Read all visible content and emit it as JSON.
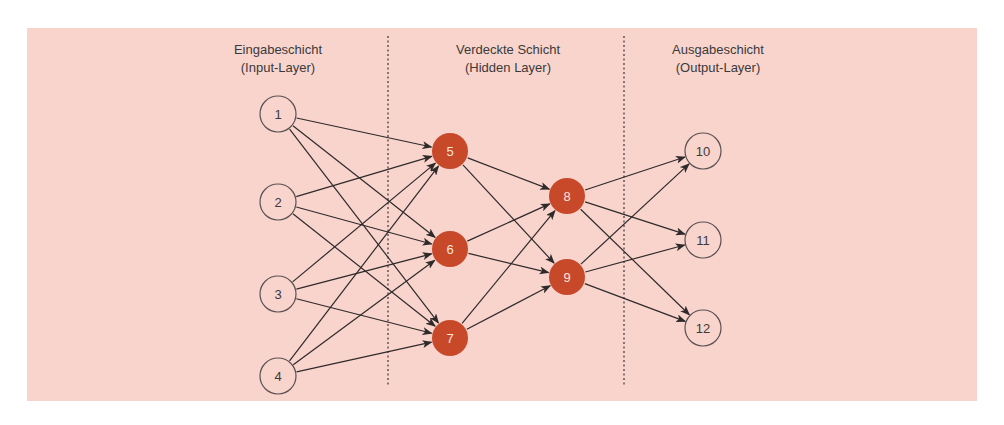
{
  "colors": {
    "background": "#f8d4cd",
    "edge": "#2f2a2a",
    "divider": "#4a4040",
    "node_outline": "#5a5050",
    "node_open_fill": "#f8d4cd",
    "node_open_text": "#3a3a3a",
    "node_hidden_fill": "#c8482a",
    "node_hidden_text": "#f8e4dc"
  },
  "layers": [
    {
      "id": "input",
      "title": "Eingabeschicht",
      "subtitle": "(Input-Layer)",
      "label_x": 278
    },
    {
      "id": "hidden",
      "title": "Verdeckte Schicht",
      "subtitle": "(Hidden Layer)",
      "label_x": 508
    },
    {
      "id": "output",
      "title": "Ausgabeschicht",
      "subtitle": "(Output-Layer)",
      "label_x": 718
    }
  ],
  "dividers": [
    {
      "x": 388
    },
    {
      "x": 624
    }
  ],
  "nodes": [
    {
      "id": "1",
      "label": "1",
      "x": 278,
      "y": 114,
      "type": "input"
    },
    {
      "id": "2",
      "label": "2",
      "x": 278,
      "y": 202,
      "type": "input"
    },
    {
      "id": "3",
      "label": "3",
      "x": 278,
      "y": 294,
      "type": "input"
    },
    {
      "id": "4",
      "label": "4",
      "x": 278,
      "y": 376,
      "type": "input"
    },
    {
      "id": "5",
      "label": "5",
      "x": 450,
      "y": 151,
      "type": "hidden"
    },
    {
      "id": "6",
      "label": "6",
      "x": 450,
      "y": 249,
      "type": "hidden"
    },
    {
      "id": "7",
      "label": "7",
      "x": 450,
      "y": 338,
      "type": "hidden"
    },
    {
      "id": "8",
      "label": "8",
      "x": 567,
      "y": 196,
      "type": "hidden"
    },
    {
      "id": "9",
      "label": "9",
      "x": 567,
      "y": 277,
      "type": "hidden"
    },
    {
      "id": "10",
      "label": "10",
      "x": 703,
      "y": 151,
      "type": "output"
    },
    {
      "id": "11",
      "label": "11",
      "x": 703,
      "y": 240,
      "type": "output"
    },
    {
      "id": "12",
      "label": "12",
      "x": 703,
      "y": 328,
      "type": "output"
    }
  ],
  "edges": [
    [
      "1",
      "5"
    ],
    [
      "1",
      "6"
    ],
    [
      "1",
      "7"
    ],
    [
      "2",
      "5"
    ],
    [
      "2",
      "6"
    ],
    [
      "2",
      "7"
    ],
    [
      "3",
      "5"
    ],
    [
      "3",
      "6"
    ],
    [
      "3",
      "7"
    ],
    [
      "4",
      "5"
    ],
    [
      "4",
      "6"
    ],
    [
      "4",
      "7"
    ],
    [
      "5",
      "8"
    ],
    [
      "5",
      "9"
    ],
    [
      "6",
      "8"
    ],
    [
      "6",
      "9"
    ],
    [
      "7",
      "8"
    ],
    [
      "7",
      "9"
    ],
    [
      "8",
      "10"
    ],
    [
      "8",
      "11"
    ],
    [
      "8",
      "12"
    ],
    [
      "9",
      "10"
    ],
    [
      "9",
      "11"
    ],
    [
      "9",
      "12"
    ]
  ],
  "node_radius": 18
}
